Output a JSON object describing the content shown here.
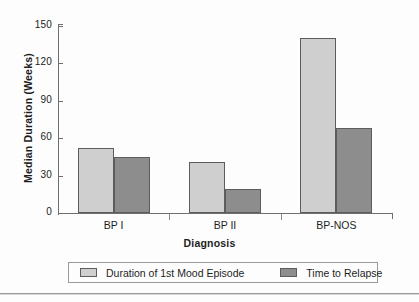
{
  "chart_data": {
    "type": "bar",
    "title": "",
    "categories": [
      "BP I",
      "BP II",
      "BP-NOS"
    ],
    "series": [
      {
        "name": "Duration of 1st Mood Episode",
        "values": [
          52,
          41,
          140
        ],
        "color": "#cfcfcf"
      },
      {
        "name": "Time to Relapse",
        "values": [
          45,
          19,
          68
        ],
        "color": "#8d8d8d"
      }
    ],
    "xlabel": "Diagnosis",
    "ylabel": "Median Duration (Weeks)",
    "ylim": [
      0,
      150
    ],
    "yticks": [
      0,
      30,
      60,
      90,
      120,
      150
    ],
    "ytick_labels": [
      "0",
      "30",
      "60",
      "90",
      "120",
      "150"
    ],
    "grid": false,
    "legend_position": "bottom"
  },
  "legend": {
    "entries": [
      {
        "label": "Duration of 1st Mood Episode"
      },
      {
        "label": "Time to Relapse"
      }
    ]
  }
}
